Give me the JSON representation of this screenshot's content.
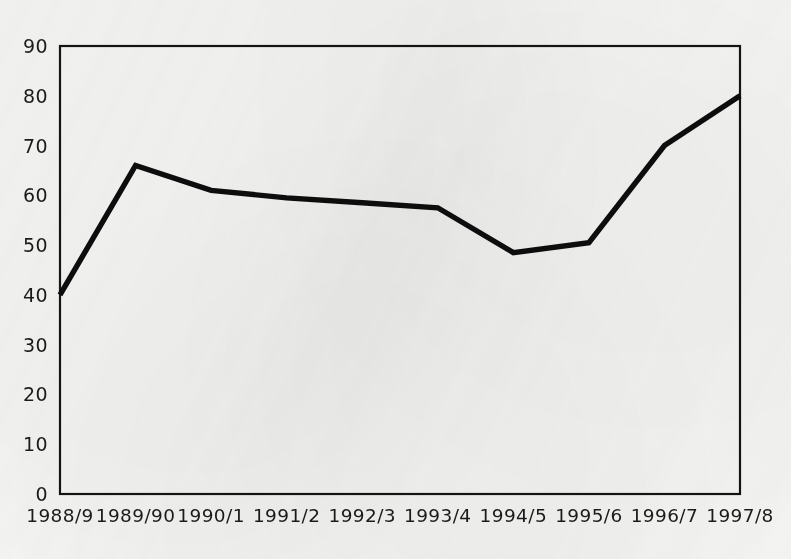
{
  "chart_data": {
    "type": "line",
    "title": "",
    "subtitle": "",
    "xlabel": "",
    "ylabel": "",
    "categories": [
      "1988/9",
      "1989/90",
      "1990/1",
      "1991/2",
      "1992/3",
      "1993/4",
      "1994/5",
      "1995/6",
      "1996/7",
      "1997/8"
    ],
    "values": [
      40,
      66,
      61,
      59.5,
      58.5,
      57.5,
      48.5,
      50.5,
      70,
      80
    ],
    "series": [
      {
        "name": "",
        "values": [
          40,
          66,
          61,
          59.5,
          58.5,
          57.5,
          48.5,
          50.5,
          70,
          80
        ]
      }
    ],
    "ylim": [
      0,
      90
    ],
    "ytick_step": 10,
    "ytick_labels": [
      "0",
      "10",
      "20",
      "30",
      "40",
      "50",
      "60",
      "70",
      "80",
      "90"
    ],
    "ytick_values": [
      0,
      10,
      20,
      30,
      40,
      50,
      60,
      70,
      80,
      90
    ],
    "grid": false,
    "legend": "none",
    "line_color": "#0d0d0d",
    "axis_color": "#141414",
    "background_color": "#f5f5f4"
  }
}
